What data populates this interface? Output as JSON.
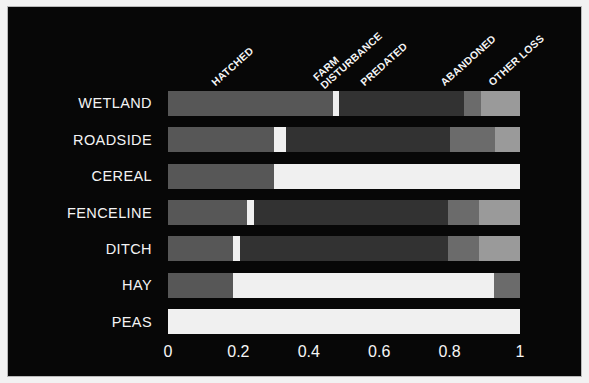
{
  "chart_data": {
    "type": "bar",
    "orientation": "horizontal",
    "stacked": true,
    "normalized": true,
    "title": "",
    "subtitle": "",
    "xlabel": "",
    "ylabel": "",
    "xlim": [
      0,
      1
    ],
    "ylim": null,
    "grid": false,
    "legend_position": "top-rotated-inline",
    "background_color": "#070707",
    "text_color": "#f4f4f4",
    "xticks": [
      "0",
      "0.2",
      "0.4",
      "0.6",
      "0.8",
      "1"
    ],
    "xtick_values": [
      0,
      0.2,
      0.4,
      0.6,
      0.8,
      1
    ],
    "categories": [
      "WETLAND",
      "ROADSIDE",
      "CEREAL",
      "FENCELINE",
      "DITCH",
      "HAY",
      "PEAS"
    ],
    "series": [
      {
        "name": "HATCHED",
        "color": "#575757",
        "values": [
          0.47,
          0.3,
          0.3,
          0.225,
          0.185,
          0.185,
          0.0
        ]
      },
      {
        "name": "FARM DISTURBANCE",
        "color": "#f0f0f0",
        "values": [
          0.015,
          0.035,
          0.7,
          0.02,
          0.02,
          0.74,
          1.0
        ]
      },
      {
        "name": "PREDATED",
        "color": "#323232",
        "values": [
          0.355,
          0.465,
          0.0,
          0.55,
          0.59,
          0.0,
          0.0
        ]
      },
      {
        "name": "ABANDONED",
        "color": "#6b6b6b",
        "values": [
          0.05,
          0.13,
          0.0,
          0.09,
          0.09,
          0.075,
          0.0
        ]
      },
      {
        "name": "OTHER LOSS",
        "color": "#9a9a9a",
        "values": [
          0.11,
          0.07,
          0.0,
          0.115,
          0.115,
          0.0,
          0.0
        ]
      }
    ]
  },
  "series_labels": [
    {
      "lines": [
        "HATCHED"
      ],
      "x": 209,
      "y": 70
    },
    {
      "lines": [
        "FARM",
        "DISTURBANCE"
      ],
      "x": 318,
      "y": 62
    },
    {
      "lines": [
        "PREDATED"
      ],
      "x": 358,
      "y": 70
    },
    {
      "lines": [
        "ABANDONED"
      ],
      "x": 438,
      "y": 70
    },
    {
      "lines": [
        "OTHER LOSS"
      ],
      "x": 486,
      "y": 70
    }
  ],
  "colors": {
    "hatched": "#575757",
    "farm_disturbance": "#f0f0f0",
    "predated": "#323232",
    "abandoned": "#6b6b6b",
    "other_loss": "#9a9a9a",
    "background": "#070707",
    "border": "#b8b8b8",
    "page": "#f2f2f2"
  }
}
